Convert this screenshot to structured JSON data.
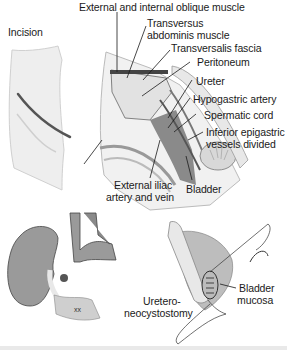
{
  "figure": {
    "panels": [
      {
        "id": "incision",
        "title": "Incision"
      },
      {
        "id": "exposure",
        "labels": [
          "External and internal oblique muscle",
          "Transversus",
          "abdominis muscle",
          "Transversalis fascia",
          "Peritoneum",
          "Ureter",
          "Hypogastric artery",
          "Spermatic cord",
          "Inferior epigastric",
          "vessels divided",
          "External iliac",
          "artery and vein",
          "Bladder"
        ]
      },
      {
        "id": "kidney-transplant",
        "labels": []
      },
      {
        "id": "ureteroneocystostomy",
        "labels": [
          "Bladder",
          "mucosa",
          "Uretero-",
          "neocystostomy"
        ]
      }
    ],
    "colors": {
      "line": "#1a1a1a",
      "tissue_dark": "#6e6e6e",
      "tissue_mid": "#9a9a9a",
      "tissue_light": "#d6d6d6",
      "skin": "#eeeeee",
      "background": "#ffffff"
    }
  }
}
